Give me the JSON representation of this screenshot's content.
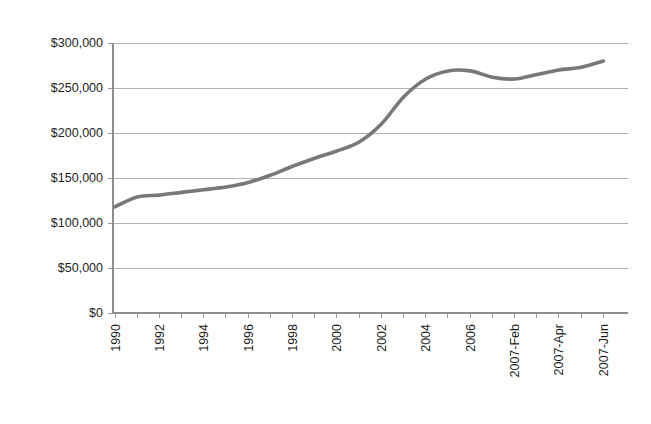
{
  "chart_data": {
    "type": "line",
    "title": "",
    "subtitle": "",
    "xlabel": "",
    "ylabel": "",
    "ylim": [
      0,
      300000
    ],
    "y_ticks": [
      0,
      50000,
      100000,
      150000,
      200000,
      250000,
      300000
    ],
    "y_tick_labels": [
      "$0",
      "$50,000",
      "$100,000",
      "$150,000",
      "$200,000",
      "$250,000",
      "$300,000"
    ],
    "x_tick_labels": [
      "1990",
      "1992",
      "1994",
      "1996",
      "1998",
      "2000",
      "2002",
      "2004",
      "2006",
      "2007-Feb",
      "2007-Apr",
      "2007-Jun"
    ],
    "grid": "horizontal",
    "legend": "none",
    "line_color": "#78787a",
    "series": [
      {
        "name": "Median Price",
        "x": [
          "1990",
          "1991",
          "1992",
          "1993",
          "1994",
          "1995",
          "1996",
          "1997",
          "1998",
          "1999",
          "2000",
          "2001",
          "2002",
          "2003",
          "2004",
          "2005",
          "2006",
          "2007-Jan",
          "2007-Feb",
          "2007-Mar",
          "2007-Apr",
          "2007-May",
          "2007-Jun"
        ],
        "values": [
          118000,
          129000,
          131000,
          134000,
          137000,
          140000,
          145000,
          153000,
          163000,
          172000,
          180000,
          190000,
          210000,
          240000,
          260000,
          269000,
          269000,
          262000,
          260000,
          265000,
          270000,
          273000,
          280000
        ]
      }
    ],
    "annotations": []
  },
  "axis": {
    "y_axis_name": "y-axis",
    "x_axis_name": "x-axis"
  }
}
